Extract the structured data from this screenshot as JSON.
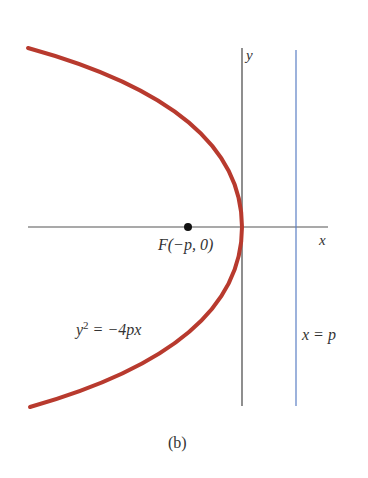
{
  "figure": {
    "caption": "(b)",
    "axes": {
      "x_label": "x",
      "y_label": "y"
    },
    "curve": {
      "equation_base": "y",
      "equation_exp": "2",
      "equation_rest": " = −4px",
      "color": "#b83a2e"
    },
    "focus": {
      "label": "F(−p, 0)"
    },
    "directrix": {
      "label": "x = p",
      "color": "#5b7fc4"
    }
  }
}
